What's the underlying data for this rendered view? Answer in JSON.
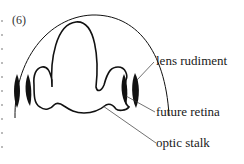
{
  "figure": {
    "panel_label": "(6)",
    "labels": {
      "lens_rudiment": "lens rudiment",
      "future_retina": "future retina",
      "optic_stalk": "optic stalk"
    },
    "colors": {
      "ink": "#111111",
      "background": "#ffffff"
    }
  }
}
